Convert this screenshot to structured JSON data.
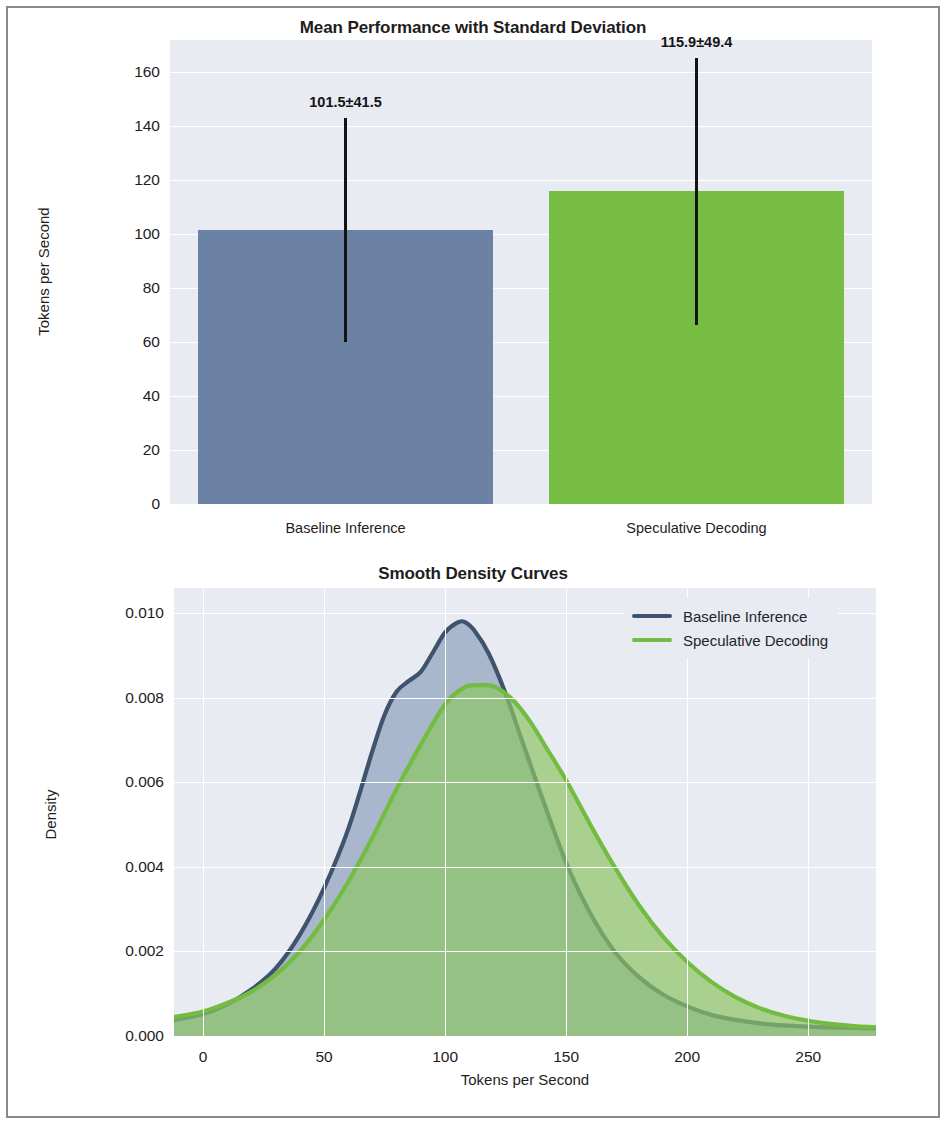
{
  "figure": {
    "background": "#ffffff",
    "border_color": "#8a8a8a",
    "plot_background": "#e9ebf2",
    "grid_color": "#ffffff"
  },
  "colors": {
    "baseline": "#6b82a4",
    "speculative": "#78bd43",
    "baseline_line": "#3f536e",
    "speculative_line": "#72bc42",
    "errorbar": "#141414",
    "text": "#1d1d1d"
  },
  "chart_data": [
    {
      "type": "bar",
      "title": "Mean Performance with Standard Deviation",
      "xlabel": "",
      "ylabel": "Tokens per Second",
      "categories": [
        "Baseline Inference",
        "Speculative Decoding"
      ],
      "values": [
        101.5,
        115.9
      ],
      "errors": [
        41.5,
        49.4
      ],
      "data_labels": [
        "101.5±41.5",
        "115.9±49.4"
      ],
      "bar_colors": [
        "#6b82a4",
        "#78bd43"
      ],
      "ylim": [
        0,
        172
      ],
      "yticks": [
        0,
        20,
        40,
        60,
        80,
        100,
        120,
        140,
        160
      ],
      "ytick_labels": [
        "0",
        "20",
        "40",
        "60",
        "80",
        "100",
        "120",
        "140",
        "160"
      ],
      "grid": true,
      "legend": null
    },
    {
      "type": "area",
      "title": "Smooth Density Curves",
      "xlabel": "Tokens per Second",
      "ylabel": "Density",
      "xlim": [
        -12,
        278
      ],
      "ylim": [
        0,
        0.0106
      ],
      "xticks": [
        0,
        50,
        100,
        150,
        200,
        250
      ],
      "xtick_labels": [
        "0",
        "50",
        "100",
        "150",
        "200",
        "250"
      ],
      "yticks": [
        0.0,
        0.002,
        0.004,
        0.006,
        0.008,
        0.01
      ],
      "ytick_labels": [
        "0.000",
        "0.002",
        "0.004",
        "0.006",
        "0.008",
        "0.010"
      ],
      "grid": true,
      "legend_position": "upper right",
      "series": [
        {
          "name": "Baseline Inference",
          "color": "#3f536e",
          "fill": "#8fa2bd",
          "x": [
            -12,
            0,
            10,
            20,
            30,
            40,
            50,
            60,
            70,
            75,
            80,
            85,
            90,
            95,
            100,
            105,
            108,
            112,
            118,
            125,
            132,
            140,
            150,
            160,
            170,
            180,
            190,
            200,
            210,
            220,
            230,
            240,
            250,
            260,
            270,
            278
          ],
          "y": [
            0.00038,
            0.00052,
            0.00075,
            0.0011,
            0.0016,
            0.0024,
            0.0035,
            0.0049,
            0.00675,
            0.0076,
            0.00815,
            0.0084,
            0.00862,
            0.00908,
            0.00955,
            0.00978,
            0.0098,
            0.0096,
            0.00905,
            0.0081,
            0.00695,
            0.00565,
            0.0041,
            0.0029,
            0.002,
            0.0014,
            0.00098,
            0.0007,
            0.0005,
            0.00038,
            0.0003,
            0.00025,
            0.00022,
            0.0002,
            0.00019,
            0.00018
          ]
        },
        {
          "name": "Speculative Decoding",
          "color": "#72bc42",
          "fill": "#8dc565",
          "x": [
            -12,
            0,
            10,
            20,
            30,
            40,
            50,
            60,
            70,
            80,
            90,
            100,
            108,
            115,
            118,
            122,
            128,
            135,
            142,
            150,
            160,
            170,
            180,
            190,
            200,
            210,
            220,
            230,
            240,
            250,
            260,
            270,
            278
          ],
          "y": [
            0.00045,
            0.00058,
            0.00078,
            0.00105,
            0.00145,
            0.002,
            0.00275,
            0.00365,
            0.0047,
            0.00585,
            0.0069,
            0.00785,
            0.00825,
            0.0083,
            0.0083,
            0.00822,
            0.00795,
            0.00745,
            0.0068,
            0.00605,
            0.005,
            0.004,
            0.0031,
            0.00235,
            0.00175,
            0.00128,
            0.00092,
            0.00066,
            0.00048,
            0.00036,
            0.00028,
            0.00023,
            0.00021
          ]
        }
      ]
    }
  ]
}
